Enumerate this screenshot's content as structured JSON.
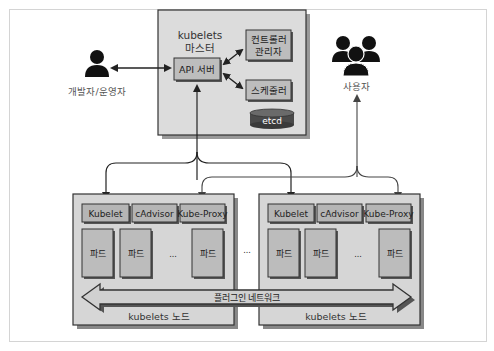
{
  "diagram": {
    "type": "kubernetes-architecture",
    "colors": {
      "frame": "#d4d4d4",
      "panel": "#d9d9d9",
      "box": "#b9b9b9",
      "border": "#333333",
      "shadow": "#555555",
      "etcd": "#555555",
      "text": "#222222"
    },
    "master": {
      "title_line1": "kubelets",
      "title_line2": "마스터",
      "api_server": "API 서버",
      "controller_line1": "컨트롤러",
      "controller_line2": "관리자",
      "scheduler": "스케줄러",
      "etcd": "etcd"
    },
    "actors": {
      "developer": {
        "label": "개발자/운영자",
        "icon": "person-icon"
      },
      "users": {
        "label": "사용자",
        "icon": "group-icon"
      }
    },
    "nodes": [
      {
        "label": "kubelets 노드",
        "components": [
          "Kubelet",
          "cAdvisor",
          "Kube-Proxy"
        ],
        "pods": [
          "파드",
          "파드",
          "...",
          "파드"
        ]
      },
      {
        "label": "kubelets 노드",
        "components": [
          "Kubelet",
          "cAdvisor",
          "Kube-Proxy"
        ],
        "pods": [
          "파드",
          "파드",
          "...",
          "파드"
        ]
      }
    ],
    "between_nodes_ellipsis": "...",
    "network": "플러그인 네트워크"
  }
}
